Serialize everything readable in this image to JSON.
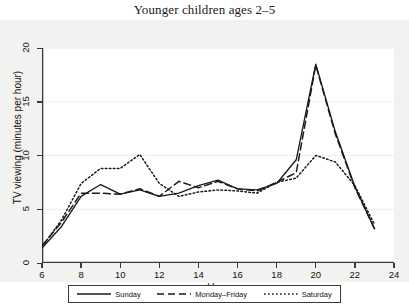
{
  "chart_data": {
    "type": "line",
    "title": "Younger children ages 2–5",
    "xlabel": "Hour",
    "ylabel": "TV viewing (minutes per hour)",
    "xlim": [
      6,
      24
    ],
    "ylim": [
      0,
      20
    ],
    "xticks": [
      6,
      8,
      10,
      12,
      14,
      16,
      18,
      20,
      22,
      24
    ],
    "yticks": [
      0,
      5,
      10,
      15,
      20
    ],
    "grid": "horizontal",
    "legend_position": "below",
    "x": [
      6,
      7,
      8,
      9,
      10,
      11,
      12,
      13,
      14,
      15,
      16,
      17,
      18,
      19,
      20,
      21,
      22,
      23
    ],
    "series": [
      {
        "name": "Sunday",
        "style": "solid",
        "values": [
          1.4,
          3.4,
          6.2,
          7.3,
          6.4,
          6.8,
          6.2,
          6.5,
          7.2,
          7.7,
          6.9,
          6.8,
          7.4,
          9.6,
          18.5,
          12.2,
          7.1,
          3.2
        ]
      },
      {
        "name": "Monday–Friday",
        "style": "dashed",
        "values": [
          1.6,
          3.8,
          6.5,
          6.5,
          6.4,
          6.9,
          6.2,
          7.6,
          7.0,
          7.6,
          6.9,
          6.7,
          7.5,
          8.4,
          18.4,
          12.0,
          7.0,
          3.2
        ]
      },
      {
        "name": "Saturday",
        "style": "dotted",
        "values": [
          1.5,
          4.0,
          7.4,
          8.8,
          8.8,
          10.1,
          7.4,
          6.2,
          6.6,
          6.8,
          6.7,
          6.5,
          7.5,
          7.9,
          10.0,
          9.4,
          7.2,
          3.6
        ]
      }
    ]
  },
  "legend": {
    "entries": [
      {
        "label": "Sunday"
      },
      {
        "label": "Monday–Friday"
      },
      {
        "label": "Saturday"
      }
    ]
  }
}
